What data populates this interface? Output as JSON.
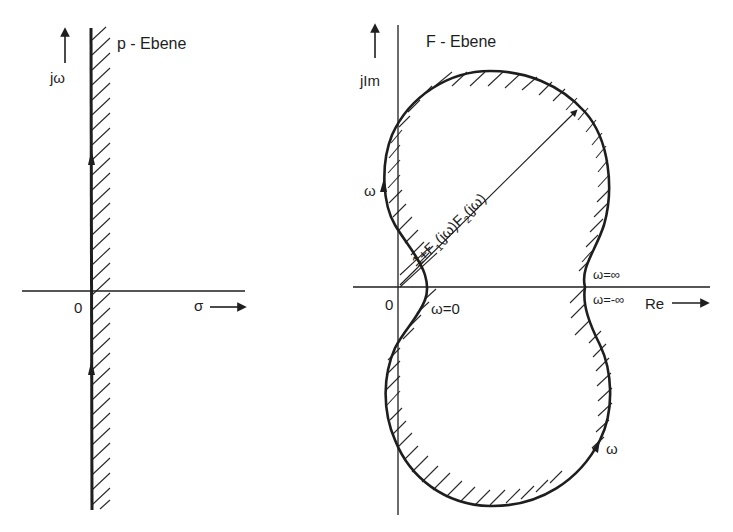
{
  "left_panel": {
    "title": "p - Ebene",
    "y_axis_label": "jω",
    "x_axis_label": "σ",
    "origin_label": "0",
    "boundary": "imaginary axis (jω), hatched on right half-plane side"
  },
  "right_panel": {
    "title": "F - Ebene",
    "y_axis_label": "jIm",
    "x_axis_label": "Re",
    "origin_label": "0",
    "curve_label_parts": [
      "1+F",
      "1",
      "(jω)F",
      "2",
      "(jω)"
    ],
    "curve_label": "1+F1(jω)F2(jω)",
    "omega_upper_label": "ω",
    "omega_lower_label": "ω",
    "omega_zero_label": "ω=0",
    "omega_inf_label": "ω=∞",
    "omega_neg_inf_label": "ω=-∞"
  },
  "colors": {
    "ink": "#1e1e1e",
    "background": "#ffffff"
  }
}
